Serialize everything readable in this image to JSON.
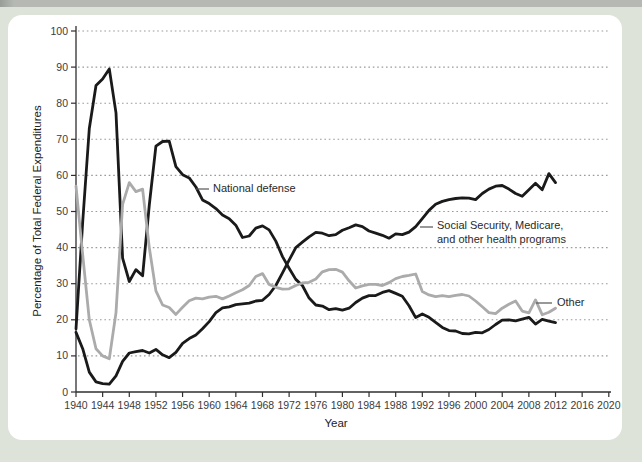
{
  "page": {
    "background_color": "#dee3da",
    "top_edge_color": "#b6b9b3",
    "panel_color": "#ffffff"
  },
  "chart_data": {
    "type": "line",
    "title": "",
    "xlabel": "Year",
    "ylabel": "Percentage of Total Federal Expenditures",
    "xlim": [
      1940,
      2020.5
    ],
    "ylim": [
      0,
      100
    ],
    "grid": "horizontal-dotted",
    "grid_color": "#9b9b9b",
    "axis_color": "#2f2f2f",
    "tick_label_color": "#3b3b3b",
    "x_ticks": [
      1940,
      1944,
      1948,
      1952,
      1956,
      1960,
      1964,
      1968,
      1972,
      1976,
      1980,
      1984,
      1988,
      1992,
      1996,
      2000,
      2004,
      2008,
      2012,
      2016,
      2020
    ],
    "y_ticks": [
      0,
      10,
      20,
      30,
      40,
      50,
      60,
      70,
      80,
      90,
      100
    ],
    "years": [
      1940,
      1941,
      1942,
      1943,
      1944,
      1945,
      1946,
      1947,
      1948,
      1949,
      1950,
      1951,
      1952,
      1953,
      1954,
      1955,
      1956,
      1957,
      1958,
      1959,
      1960,
      1961,
      1962,
      1963,
      1964,
      1965,
      1966,
      1967,
      1968,
      1969,
      1970,
      1971,
      1972,
      1973,
      1974,
      1975,
      1976,
      1977,
      1978,
      1979,
      1980,
      1981,
      1982,
      1983,
      1984,
      1985,
      1986,
      1987,
      1988,
      1989,
      1990,
      1991,
      1992,
      1993,
      1994,
      1995,
      1996,
      1997,
      1998,
      1999,
      2000,
      2001,
      2002,
      2003,
      2004,
      2005,
      2006,
      2007,
      2008,
      2009,
      2010,
      2011,
      2012
    ],
    "series": [
      {
        "name": "National defense",
        "color": "#1a1a1a",
        "values": [
          17.5,
          47.1,
          73,
          84.9,
          86.7,
          89.5,
          77.3,
          37.1,
          30.6,
          33.9,
          32.2,
          51.8,
          68.1,
          69.4,
          69.5,
          62.4,
          60.2,
          59.3,
          56.8,
          53.2,
          52.2,
          50.8,
          49,
          48,
          46.2,
          42.8,
          43.2,
          45.4,
          46,
          44.9,
          41.8,
          37.5,
          34.3,
          31.2,
          29.5,
          26,
          24.1,
          23.8,
          22.8,
          23.1,
          22.7,
          23.2,
          24.8,
          26,
          26.7,
          26.7,
          27.6,
          28.1,
          27.3,
          26.5,
          23.9,
          20.6,
          21.6,
          20.7,
          19.3,
          17.9,
          17,
          16.9,
          16.2,
          16.1,
          16.5,
          16.4,
          17.3,
          18.7,
          19.9,
          20,
          19.7,
          20.2,
          20.7,
          18.8,
          20.1,
          19.6,
          19.2
        ]
      },
      {
        "name": "Social Security, Medicare, and other health programs",
        "color": "#1a1a1a",
        "values": [
          16.5,
          12,
          5.5,
          2.8,
          2.3,
          2.2,
          4.5,
          8.5,
          10.8,
          11.2,
          11.5,
          10.8,
          11.8,
          10.3,
          9.5,
          11,
          13.5,
          14.8,
          15.8,
          17.5,
          19.5,
          22,
          23.3,
          23.6,
          24.2,
          24.4,
          24.6,
          25.2,
          25.4,
          27,
          29.5,
          33,
          36.5,
          40,
          41.5,
          43,
          44.2,
          44,
          43.3,
          43.6,
          44.8,
          45.5,
          46.3,
          45.8,
          44.6,
          44,
          43.4,
          42.6,
          43.8,
          43.6,
          44.3,
          45.8,
          48,
          50.3,
          52,
          52.8,
          53.3,
          53.6,
          53.8,
          53.7,
          53.3,
          55,
          56.2,
          57,
          57.2,
          56.2,
          55,
          54.2,
          56,
          57.8,
          56,
          60.5,
          58
        ]
      },
      {
        "name": "Other",
        "color": "#ababab",
        "values": [
          57,
          38,
          20,
          12,
          10,
          9.2,
          22,
          52,
          58,
          55.5,
          56.2,
          40,
          28,
          24.1,
          23.4,
          21.5,
          23.5,
          25.3,
          26,
          25.8,
          26.3,
          26.5,
          25.8,
          26.6,
          27.5,
          28.3,
          29.5,
          32,
          32.8,
          29.8,
          29,
          28.5,
          28.6,
          29.5,
          30.2,
          30.4,
          31.3,
          33.3,
          33.9,
          34,
          33.2,
          30.8,
          28.8,
          29.4,
          29.8,
          29.8,
          29.5,
          30.3,
          31.4,
          32,
          32.3,
          32.7,
          27.8,
          26.9,
          26.4,
          26.7,
          26.4,
          26.8,
          27,
          26.6,
          25.2,
          23.6,
          22,
          21.7,
          23.2,
          24.3,
          25.2,
          22.4,
          21.9,
          25.5,
          21.4,
          22.1,
          23.2
        ]
      }
    ],
    "annotations": {
      "defense": {
        "text": "National defense",
        "dash": [
          196,
          189,
          209,
          189
        ]
      },
      "ss_line1": {
        "text": "Social Security, Medicare,"
      },
      "ss_line2": {
        "text": "and other health programs"
      },
      "ss_dash": [
        420,
        227,
        433,
        227
      ],
      "other": {
        "text": "Other",
        "dash": [
          536,
          303,
          552,
          303
        ]
      }
    },
    "legend_position": "none"
  }
}
